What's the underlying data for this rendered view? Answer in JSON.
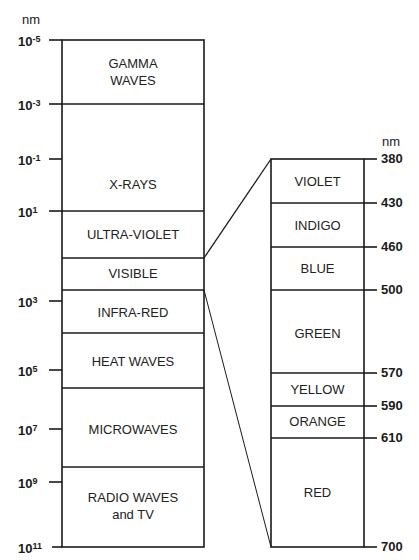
{
  "left_scale": {
    "unit": "nm",
    "ticks": [
      {
        "base": "10",
        "exp": "-5",
        "y": 40
      },
      {
        "base": "10",
        "exp": "-3",
        "y": 104
      },
      {
        "base": "10",
        "exp": "-1",
        "y": 159
      },
      {
        "base": "10",
        "exp": "1",
        "y": 211
      },
      {
        "base": "10",
        "exp": "3",
        "y": 301
      },
      {
        "base": "10",
        "exp": "5",
        "y": 370
      },
      {
        "base": "10",
        "exp": "7",
        "y": 429
      },
      {
        "base": "10",
        "exp": "9",
        "y": 482
      },
      {
        "base": "10",
        "exp": "11",
        "y": 547
      }
    ],
    "bands": [
      {
        "name": "GAMMA WAVES",
        "lines": [
          "GAMMA",
          "WAVES"
        ],
        "top": 40,
        "bottom": 104
      },
      {
        "name": "X-RAYS",
        "lines": [
          "X-RAYS"
        ],
        "top": 104,
        "bottom": 211
      },
      {
        "name": "ULTRA-VIOLET",
        "lines": [
          "ULTRA-VIOLET"
        ],
        "top": 211,
        "bottom": 258
      },
      {
        "name": "VISIBLE",
        "lines": [
          "VISIBLE"
        ],
        "top": 258,
        "bottom": 290
      },
      {
        "name": "INFRA-RED",
        "lines": [
          "INFRA-RED"
        ],
        "top": 290,
        "bottom": 333
      },
      {
        "name": "HEAT WAVES",
        "lines": [
          "HEAT WAVES"
        ],
        "top": 333,
        "bottom": 388
      },
      {
        "name": "MICROWAVES",
        "lines": [
          "MICROWAVES"
        ],
        "top": 388,
        "bottom": 467
      },
      {
        "name": "RADIO WAVES and TV",
        "lines": [
          "RADIO WAVES",
          "and TV"
        ],
        "top": 467,
        "bottom": 547
      }
    ]
  },
  "right_scale": {
    "unit": "nm",
    "ticks": [
      {
        "label": "380",
        "y": 159
      },
      {
        "label": "430",
        "y": 203
      },
      {
        "label": "460",
        "y": 247
      },
      {
        "label": "500",
        "y": 290
      },
      {
        "label": "570",
        "y": 373
      },
      {
        "label": "590",
        "y": 406
      },
      {
        "label": "610",
        "y": 438
      },
      {
        "label": "700",
        "y": 547
      }
    ],
    "bands": [
      {
        "name": "VIOLET",
        "top": 159,
        "bottom": 203
      },
      {
        "name": "INDIGO",
        "top": 203,
        "bottom": 247
      },
      {
        "name": "BLUE",
        "top": 247,
        "bottom": 290
      },
      {
        "name": "GREEN",
        "top": 290,
        "bottom": 373
      },
      {
        "name": "YELLOW",
        "top": 373,
        "bottom": 406
      },
      {
        "name": "ORANGE",
        "top": 406,
        "bottom": 438
      },
      {
        "name": "RED",
        "top": 438,
        "bottom": 547
      }
    ]
  },
  "labels": {
    "left_unit": "nm",
    "right_unit": "nm",
    "gamma_1": "GAMMA",
    "gamma_2": "WAVES",
    "xrays": "X-RAYS",
    "uv": "ULTRA-VIOLET",
    "visible": "VISIBLE",
    "ir": "INFRA-RED",
    "heat": "HEAT WAVES",
    "micro": "MICROWAVES",
    "radio_1": "RADIO WAVES",
    "radio_2": "and TV",
    "violet": "VIOLET",
    "indigo": "INDIGO",
    "blue": "BLUE",
    "green": "GREEN",
    "yellow": "YELLOW",
    "orange": "ORANGE",
    "red": "RED",
    "t380": "380",
    "t430": "430",
    "t460": "460",
    "t500": "500",
    "t570": "570",
    "t590": "590",
    "t610": "610",
    "t700": "700",
    "base": "10",
    "e_m5": "-5",
    "e_m3": "-3",
    "e_m1": "-1",
    "e_1": "1",
    "e_3": "3",
    "e_5": "5",
    "e_7": "7",
    "e_9": "9",
    "e_11": "11"
  },
  "colors": {
    "line": "#1a1a1a",
    "background": "#ffffff"
  }
}
